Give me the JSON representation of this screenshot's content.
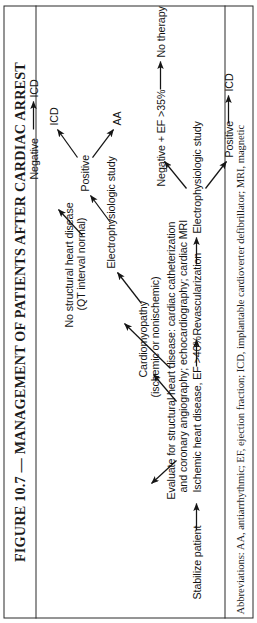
{
  "figure": {
    "title_prefix": "FIGURE 10.7",
    "title_dash": "—",
    "title_main": "MANAGEMENT OF PATIENTS AFTER CARDIAC ARREST",
    "title_full": "FIGURE 10.7 — MANAGEMENT OF PATIENTS AFTER CARDIAC ARREST",
    "abbreviations": "Abbreviations: AA, antiarrhythmic; EF, ejection fraction; ICD, implantable cardioverter defibrillator; MRI, magnetic",
    "orientation": "rotated-90-ccw",
    "colors": {
      "ink": "#131313",
      "rule": "#2a2a2a",
      "background": "#ffffff"
    }
  },
  "flow": {
    "start": "Stabilize patient",
    "evaluate": "Evaluate for structural heart disease: cardiac catheterization\nand coronary angiography; echocardiography; cardiac MRI",
    "evaluate_line1": "Evaluate for structural heart disease: cardiac catheterization",
    "evaluate_line2": "and coronary angiography; echocardiography; cardiac MRI",
    "branch_ischemic": "Ischemic heart disease, EF >40%",
    "revascularization": "Revascularization",
    "eps_ischemic": "Electrophysiologic study",
    "eps_ischemic_positive": "Positive",
    "eps_ischemic_positive_result": "ICD",
    "eps_ischemic_negative": "Negative + EF >35%",
    "eps_ischemic_negative_result": "No therapy",
    "branch_cardiomyopathy_line1": "Cardiomyopathy",
    "branch_cardiomyopathy_line2": "(ischemic or nonischemic)",
    "eps_cardiomyopathy": "Electrophysiologic study",
    "eps_cm_positive": "Positive",
    "eps_cm_positive_result_a": "AA",
    "eps_cm_positive_result_b": "ICD",
    "eps_cm_negative": "Negative",
    "eps_cm_negative_result": "ICD",
    "branch_nostructural_line1": "No structural heart disease",
    "branch_nostructural_line2": "(QT interval normal)"
  }
}
